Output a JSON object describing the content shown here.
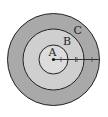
{
  "diagram": {
    "type": "concentric-circles",
    "center": {
      "x": 53.5,
      "y": 59.5
    },
    "circles": [
      {
        "name": "outer",
        "label": "C",
        "radius": 46,
        "fill": "#a9a9a9"
      },
      {
        "name": "middle",
        "label": "B",
        "radius": 30.5,
        "fill": "#cfcfcf"
      },
      {
        "name": "inner",
        "label": "A",
        "radius": 14.5,
        "fill": "#dcdcdc"
      }
    ],
    "labels": {
      "a": "A",
      "b": "B",
      "c": "C"
    },
    "radius_line": {
      "tick_marks": [
        "single",
        "double",
        "single"
      ]
    },
    "colors": {
      "stroke": "#222222",
      "background": "#ffffff"
    }
  }
}
